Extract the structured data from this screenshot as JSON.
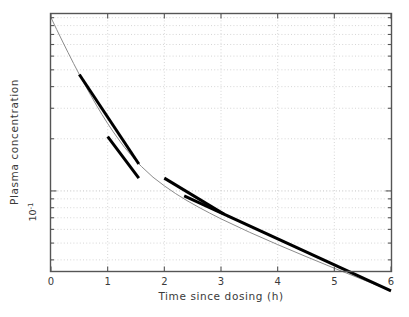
{
  "figure": {
    "background": "#ffffff",
    "plot_frame_color": "#555555",
    "grid_color": "#cccccc",
    "curve_color": "#8c8c8c",
    "tangent_color": "#000000"
  },
  "axes": {
    "x_title": "Time since dosing (h)",
    "y_title": "Plasma concentration",
    "x_ticks": [
      "0",
      "1",
      "2",
      "3",
      "4",
      "5",
      "6"
    ],
    "y_tick_label": "10",
    "y_tick_exponent": "-1"
  },
  "chart_data": {
    "type": "line",
    "title": "",
    "subtitle": "",
    "xlabel": "Time since dosing (h)",
    "ylabel": "Plasma concentration",
    "xlim": [
      0,
      6
    ],
    "ylim": [
      0.0345,
      1.05
    ],
    "yscale": "log",
    "xscale": "linear",
    "grid": true,
    "grid_style": "dotted",
    "legend": "none",
    "xticks": [
      0,
      1,
      2,
      3,
      4,
      5,
      6
    ],
    "xticklabels": [
      "0",
      "1",
      "2",
      "3",
      "4",
      "5",
      "6"
    ],
    "yticks_major": [
      0.1
    ],
    "yticklabels_major": [
      "10^-1"
    ],
    "yticks_minor": [
      0.04,
      0.05,
      0.06,
      0.07,
      0.08,
      0.09,
      0.2,
      0.3,
      0.4,
      0.5,
      0.6,
      0.7,
      0.8,
      0.9,
      1.0
    ],
    "series": [
      {
        "name": "plasma concentration curve",
        "style": "thin solid line",
        "color": "#8c8c8c",
        "x": [
          0.0,
          0.1,
          0.2,
          0.3,
          0.4,
          0.5,
          0.6,
          0.7,
          0.8,
          0.9,
          1.0,
          1.1,
          1.2,
          1.3,
          1.4,
          1.5,
          1.6,
          1.8,
          2.0,
          2.2,
          2.4,
          2.6,
          2.8,
          3.0,
          3.5,
          4.0,
          4.5,
          5.0,
          5.5,
          6.0
        ],
        "y": [
          1.0,
          0.855,
          0.733,
          0.63,
          0.543,
          0.47,
          0.409,
          0.357,
          0.313,
          0.276,
          0.245,
          0.219,
          0.197,
          0.178,
          0.163,
          0.149,
          0.138,
          0.12,
          0.107,
          0.0965,
          0.0879,
          0.0807,
          0.0745,
          0.069,
          0.0578,
          0.049,
          0.0418,
          0.0358,
          0.0308,
          0.0265
        ]
      },
      {
        "name": "tangent-segment-1",
        "style": "thick solid line",
        "color": "#000000",
        "x": [
          0.5,
          1.55
        ],
        "y": [
          0.47,
          0.143
        ]
      },
      {
        "name": "tangent-segment-2",
        "style": "thick solid line",
        "color": "#000000",
        "x": [
          1.0,
          1.55
        ],
        "y": [
          0.206,
          0.1185
        ]
      },
      {
        "name": "tangent-segment-3",
        "style": "thick solid line",
        "color": "#000000",
        "x": [
          2.0,
          3.05
        ],
        "y": [
          0.1185,
          0.0735
        ]
      },
      {
        "name": "tangent-segment-4",
        "style": "thick solid line",
        "color": "#000000",
        "x": [
          2.35,
          6.0
        ],
        "y": [
          0.0935,
          0.0265
        ]
      }
    ],
    "annotations": []
  }
}
